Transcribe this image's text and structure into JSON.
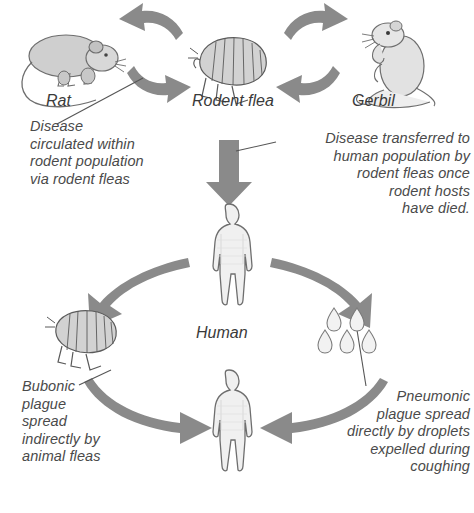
{
  "diagram": {
    "colors": {
      "arrow_gray": "#8a8a8a",
      "figure_fill": "#efefef",
      "figure_stroke": "#6e6e6e",
      "text_gray": "#4a4a4a",
      "background": "#ffffff"
    },
    "labels": [
      {
        "id": "rat",
        "text": "Rat"
      },
      {
        "id": "rodent-flea",
        "text": "Rodent flea"
      },
      {
        "id": "gerbil",
        "text": "Gerbil"
      },
      {
        "id": "human",
        "text": "Human"
      }
    ],
    "annotations": [
      {
        "id": "disease-circulated",
        "lines": [
          "Disease",
          "circulated within",
          "rodent population",
          "via rodent fleas"
        ],
        "align": "left"
      },
      {
        "id": "disease-transferred",
        "lines": [
          "Disease transferred to",
          "human population by",
          "rodent fleas once",
          "rodent hosts",
          "have died."
        ],
        "align": "right"
      },
      {
        "id": "bubonic-plague",
        "lines": [
          "Bubonic",
          "plague",
          "spread",
          "indirectly by",
          "animal fleas"
        ],
        "align": "left"
      },
      {
        "id": "pneumonic-plague",
        "lines": [
          "Pneumonic",
          "plague spread",
          "directly by droplets",
          "expelled during",
          "coughing"
        ],
        "align": "right"
      }
    ],
    "figures": [
      {
        "id": "rat-figure",
        "name": "rat-illustration"
      },
      {
        "id": "rodent-flea-figure",
        "name": "flea-illustration"
      },
      {
        "id": "gerbil-figure",
        "name": "gerbil-illustration"
      },
      {
        "id": "human-upper-figure",
        "name": "human-silhouette"
      },
      {
        "id": "flea-lower-figure",
        "name": "flea-illustration"
      },
      {
        "id": "droplets-figure",
        "name": "droplets-illustration",
        "count": 5
      },
      {
        "id": "human-lower-figure",
        "name": "human-silhouette"
      }
    ],
    "arrows": [
      {
        "id": "flea-to-rat",
        "from": "rodent-flea",
        "to": "rat",
        "shape": "curved"
      },
      {
        "id": "rat-to-flea",
        "from": "rat",
        "to": "rodent-flea",
        "shape": "curved"
      },
      {
        "id": "flea-to-gerbil",
        "from": "rodent-flea",
        "to": "gerbil",
        "shape": "curved"
      },
      {
        "id": "gerbil-to-flea",
        "from": "gerbil",
        "to": "rodent-flea",
        "shape": "curved"
      },
      {
        "id": "flea-to-human",
        "from": "rodent-flea",
        "to": "human",
        "shape": "straight-down"
      },
      {
        "id": "human-to-flea-lower",
        "from": "human",
        "to": "animal-flea",
        "shape": "curved"
      },
      {
        "id": "human-to-droplets",
        "from": "human",
        "to": "droplets",
        "shape": "curved"
      },
      {
        "id": "flea-lower-to-human",
        "from": "animal-flea",
        "to": "human-lower",
        "shape": "curved"
      },
      {
        "id": "droplets-to-human",
        "from": "droplets",
        "to": "human-lower",
        "shape": "curved"
      }
    ]
  }
}
